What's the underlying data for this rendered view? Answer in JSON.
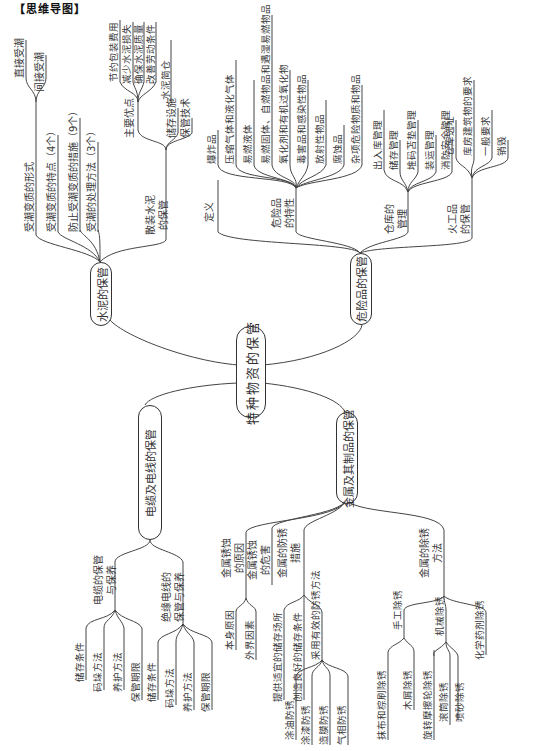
{
  "header": {
    "title": "【思维导图】"
  },
  "root": {
    "label": "特种物资的保管"
  },
  "branches": {
    "cement": {
      "label": "水泥的保管",
      "children": {
        "damp_forms": {
          "label": "受潮变质的形式",
          "items": [
            "直接受潮",
            "间接受潮"
          ]
        },
        "damp_features": {
          "label": "受潮变质的特点（4个）"
        },
        "prevent": {
          "label": "防止受潮变质的措施（9个）"
        },
        "treat": {
          "label": "受潮的处理方法（3个）"
        },
        "bulk": {
          "label": "散装水泥\n的保管",
          "advantages": {
            "label": "主要优点",
            "items": [
              "节约包装费用",
              "减少水泥损失",
              "确保水泥质量",
              "改善劳动条件",
              "水泥简仓"
            ]
          },
          "items": [
            "储存设施",
            "保管技术"
          ]
        }
      }
    },
    "hazmat": {
      "label": "危险品的保管",
      "children": {
        "definition": {
          "label": "定义"
        },
        "features": {
          "label": "危险品\n的特性",
          "items": [
            "爆炸品",
            "压缩气体和液化气体",
            "易燃液体",
            "易燃固体、自燃物品和遇湿易燃物品",
            "氧化剂和有机过氧化物",
            "毒害品和感染性物品",
            "放射性物品",
            "腐蚀品",
            "杂项危险物质和物品"
          ]
        },
        "warehouse": {
          "label": "仓库的\n管理",
          "items": [
            "出入库管理",
            "储存管理",
            "堆码苫垫管理",
            "装运管理",
            "消防安全管理"
          ]
        },
        "explosives": {
          "label": "火工品\n的保管",
          "items": [
            "仓库选址",
            "库房建筑物的要求",
            "一般要求",
            "销毁"
          ]
        }
      }
    },
    "cable": {
      "label": "电缆及电线的保管",
      "children": {
        "cable_care": {
          "label": "电缆的保管\n与保养",
          "items": [
            "储存条件",
            "码垛方法",
            "养护方法",
            "保管期限"
          ]
        },
        "wire_care": {
          "label": "绝缘电线的\n保管与保养",
          "items": [
            "储存条件",
            "码垛方法",
            "养护方法",
            "保管期限"
          ]
        }
      }
    },
    "metal": {
      "label": "金属及其制品的保管",
      "children": {
        "cause": {
          "label": "金属锈蚀\n的原因",
          "items": [
            "本身原因",
            "外界因素"
          ]
        },
        "harm": {
          "label": "金属锈蚀\n的危害"
        },
        "prevention": {
          "label": "金属的防锈\n措施",
          "items": [
            "提供适宜的储存场所",
            "创造良好的储存条件"
          ],
          "effective": {
            "label": "采用有效的防锈方法",
            "items": [
              "涂油防锈",
              "涂漆防锈",
              "造膜防锈",
              "气相防锈"
            ]
          }
        },
        "removal": {
          "label": "金属的除锈\n方法",
          "manual": {
            "label": "手工除锈",
            "items": [
              "抹布和棕刷除锈",
              "木屑除锈"
            ]
          },
          "items": [
            "旋转摩擦轮除锈"
          ],
          "mechanical": {
            "label": "机械除锈",
            "items": [
              "滚筒除锈",
              "喷砂除锈"
            ]
          },
          "chemical": {
            "label": "化学药剂除锈"
          }
        }
      }
    }
  }
}
